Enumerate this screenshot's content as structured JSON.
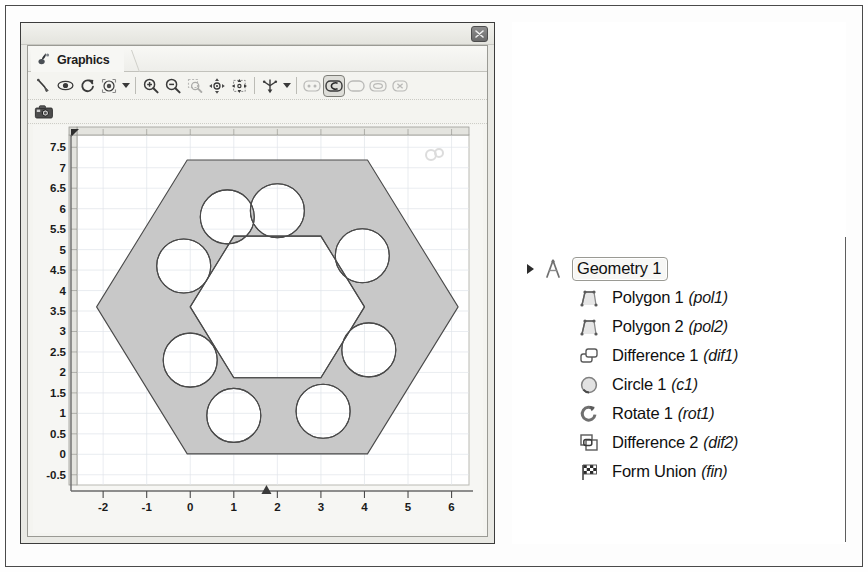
{
  "window": {
    "title_bar_visible": true,
    "close_button_icon": "close-icon",
    "tab": {
      "label": "Graphics",
      "icon": "graphics-icon"
    }
  },
  "toolbar": {
    "items": [
      {
        "name": "select-pointer-tool",
        "icon": "pointer-icon",
        "state": "normal"
      },
      {
        "name": "show-hide-tool",
        "icon": "eye-icon",
        "state": "normal"
      },
      {
        "name": "refresh-tool",
        "icon": "refresh-icon",
        "state": "normal"
      },
      {
        "name": "scene-light-tool",
        "icon": "scene-light-icon",
        "state": "normal"
      },
      {
        "name": "scene-light-dropdown",
        "icon": "chevron-down-icon",
        "state": "normal"
      },
      {
        "name": "separator-1",
        "icon": "separator",
        "state": "normal"
      },
      {
        "name": "zoom-in-tool",
        "icon": "zoom-in-icon",
        "state": "normal"
      },
      {
        "name": "zoom-out-tool",
        "icon": "zoom-out-icon",
        "state": "normal"
      },
      {
        "name": "zoom-box-tool",
        "icon": "zoom-box-icon",
        "state": "dim"
      },
      {
        "name": "zoom-extents-tool",
        "icon": "zoom-extents-icon",
        "state": "normal"
      },
      {
        "name": "pan-tool",
        "icon": "move-icon",
        "state": "normal"
      },
      {
        "name": "separator-2",
        "icon": "separator",
        "state": "normal"
      },
      {
        "name": "axis-orientation-tool",
        "icon": "axis-icon",
        "state": "normal"
      },
      {
        "name": "axis-dropdown",
        "icon": "chevron-down-icon",
        "state": "normal"
      },
      {
        "name": "separator-3",
        "icon": "separator",
        "state": "normal"
      },
      {
        "name": "select-points-tool",
        "icon": "select-points-icon",
        "state": "dim"
      },
      {
        "name": "select-edges-tool",
        "icon": "select-edges-icon",
        "state": "selected"
      },
      {
        "name": "select-boundary-tool",
        "icon": "select-boundary-icon",
        "state": "dim"
      },
      {
        "name": "select-domain-tool",
        "icon": "select-domain-icon",
        "state": "dim"
      },
      {
        "name": "clear-selection-tool",
        "icon": "clear-selection-icon",
        "state": "dim"
      }
    ],
    "snapshot": {
      "name": "snapshot-tool",
      "icon": "camera-icon"
    }
  },
  "chart_data": {
    "type": "geometry-2d",
    "title": "",
    "xlabel": "",
    "ylabel": "",
    "xlim": [
      -2.6,
      6.4
    ],
    "ylim": [
      -0.75,
      7.8
    ],
    "xticks": [
      -2,
      -1,
      0,
      1,
      2,
      3,
      4,
      5,
      6
    ],
    "yticks": [
      -0.5,
      0,
      0.5,
      1,
      1.5,
      2,
      2.5,
      3,
      3.5,
      4,
      4.5,
      5,
      5.5,
      6,
      6.5,
      7,
      7.5
    ],
    "ytick_labels": [
      "-0.5",
      "0",
      "0.5",
      "1",
      "1.5",
      "2",
      "2.5",
      "3",
      "3.5",
      "4",
      "4.5",
      "5",
      "5.5",
      "6",
      "6.5",
      "7",
      "7.5"
    ],
    "xtick_labels": [
      "-2",
      "-1",
      "0",
      "1",
      "2",
      "3",
      "4",
      "5",
      "6"
    ],
    "grid": true,
    "grid_color": "#d9dfe4",
    "fill_color": "#c8c8c8",
    "edge_color": "#4a4a4a",
    "background": "#ffffff",
    "x_axis_marker": 1.75,
    "shapes": {
      "outer_hexagon": {
        "name": "pol1",
        "center": [
          2.0,
          3.6
        ],
        "circumradius": 4.15,
        "vertices": [
          [
            6.15,
            3.6
          ],
          [
            4.07,
            7.19
          ],
          [
            -0.07,
            7.19
          ],
          [
            -2.15,
            3.6
          ],
          [
            -0.07,
            0.01
          ],
          [
            4.07,
            0.01
          ]
        ]
      },
      "inner_hexagon": {
        "name": "pol2",
        "center": [
          2.0,
          3.6
        ],
        "circumradius": 2.0,
        "vertices": [
          [
            4.0,
            3.6
          ],
          [
            3.0,
            5.33
          ],
          [
            1.0,
            5.33
          ],
          [
            0.0,
            3.6
          ],
          [
            1.0,
            1.87
          ],
          [
            3.0,
            1.87
          ]
        ]
      },
      "circles": {
        "name": "c1 / rot1",
        "radius": 0.62,
        "count": 8,
        "centers": [
          [
            2.0,
            5.95
          ],
          [
            3.95,
            4.85
          ],
          [
            4.1,
            2.55
          ],
          [
            3.05,
            1.05
          ],
          [
            1.0,
            0.95
          ],
          [
            0.0,
            2.3
          ],
          [
            -0.15,
            4.6
          ],
          [
            0.85,
            5.8
          ]
        ]
      }
    },
    "watermark": "comsol-logo-watermark"
  },
  "tree": {
    "root": {
      "label": "Geometry 1",
      "icon": "geometry-compass-icon",
      "expanded": true,
      "selected": true
    },
    "items": [
      {
        "label": "Polygon 1",
        "tag": "(pol1)",
        "icon": "polygon-icon"
      },
      {
        "label": "Polygon 2",
        "tag": "(pol2)",
        "icon": "polygon-icon"
      },
      {
        "label": "Difference 1",
        "tag": "(dif1)",
        "icon": "difference-icon"
      },
      {
        "label": "Circle 1",
        "tag": "(c1)",
        "icon": "circle-icon"
      },
      {
        "label": "Rotate 1",
        "tag": "(rot1)",
        "icon": "rotate-icon"
      },
      {
        "label": "Difference 2",
        "tag": "(dif2)",
        "icon": "difference-icon"
      },
      {
        "label": "Form Union",
        "tag": "(fin)",
        "icon": "form-union-flag-icon"
      }
    ]
  },
  "colors": {
    "shape_fill": "#c8c8c8",
    "shape_edge": "#4a4a4a",
    "panel_bg": "#f4f4f0",
    "frame": "#3c3c3c",
    "grid": "#d9dfe4"
  }
}
